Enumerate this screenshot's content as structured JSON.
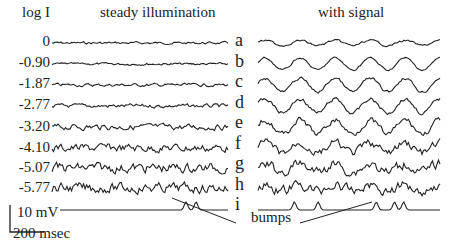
{
  "figure": {
    "column_headers": {
      "left_axis": "log I",
      "left": "steady illumination",
      "right": "with signal"
    },
    "log_intensities": [
      "0",
      "-0.90",
      "-1.87",
      "-2.77",
      "-3.20",
      "-4.10",
      "-5.07",
      "-5.77"
    ],
    "trace_letters": [
      "a",
      "b",
      "c",
      "d",
      "e",
      "f",
      "g",
      "h",
      "i"
    ],
    "scale_bar": {
      "voltage": "10 mV",
      "time": "200 msec"
    },
    "annotation": "bumps",
    "trace_color": "#222222"
  },
  "chart_data": {
    "type": "line",
    "title": "",
    "panels": [
      {
        "name": "steady illumination",
        "rows": [
          {
            "log_I": 0,
            "noise_amp": 1.2
          },
          {
            "log_I": -0.9,
            "noise_amp": 1.2
          },
          {
            "log_I": -1.87,
            "noise_amp": 1.6
          },
          {
            "log_I": -2.77,
            "noise_amp": 2.0
          },
          {
            "log_I": -3.2,
            "noise_amp": 3.0
          },
          {
            "log_I": -4.1,
            "noise_amp": 4.2
          },
          {
            "log_I": -5.07,
            "noise_amp": 5.0
          },
          {
            "log_I": -5.77,
            "noise_amp": 5.0
          },
          {
            "log_I": null,
            "noise_amp": 0,
            "bumps_at_fraction": [
              0.75,
              0.81
            ]
          }
        ]
      },
      {
        "name": "with signal",
        "rows": [
          {
            "label": "a",
            "signal_amp": 2.5,
            "noise_amp": 1
          },
          {
            "label": "b",
            "signal_amp": 6,
            "noise_amp": 1
          },
          {
            "label": "c",
            "signal_amp": 7,
            "noise_amp": 1.5
          },
          {
            "label": "d",
            "signal_amp": 7,
            "noise_amp": 2
          },
          {
            "label": "e",
            "signal_amp": 7,
            "noise_amp": 3
          },
          {
            "label": "f",
            "signal_amp": 5,
            "noise_amp": 4
          },
          {
            "label": "g",
            "signal_amp": 4,
            "noise_amp": 5
          },
          {
            "label": "h",
            "signal_amp": 3,
            "noise_amp": 5
          },
          {
            "label": "i",
            "signal_amp": 0,
            "noise_amp": 0,
            "bumps_at_fraction": [
              0.2,
              0.33,
              0.65,
              0.75,
              0.8
            ]
          }
        ]
      }
    ],
    "xlabel": "time (scale 200 msec)",
    "ylabel": "membrane potential (scale 10 mV)"
  }
}
